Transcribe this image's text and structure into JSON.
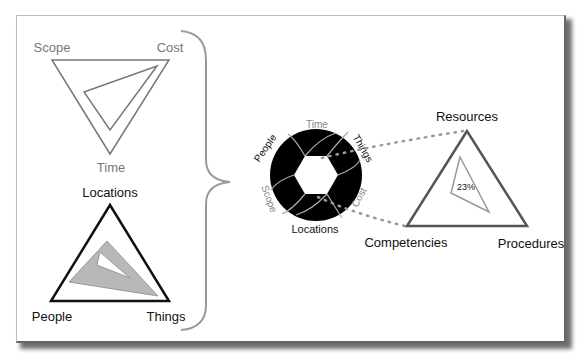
{
  "project_triangle": {
    "labels": {
      "top_left": "Scope",
      "top_right": "Cost",
      "bottom": "Time"
    },
    "colors": {
      "outline": "#777777",
      "text": "#777777"
    }
  },
  "asset_triangle": {
    "labels": {
      "top": "Locations",
      "bottom_left": "People",
      "bottom_right": "Things"
    },
    "colors": {
      "outline": "#111111",
      "text": "#111111",
      "set_square": "#b8b8b8"
    }
  },
  "aperture": {
    "labels": {
      "top": "Time",
      "upper_left": "People",
      "upper_right": "Things",
      "lower_left": "Scope",
      "lower_right": "Cost",
      "bottom": "Locations"
    },
    "colors": {
      "fill": "#000000",
      "blade_lines": "#aaaaaa",
      "gray_text": "#888888",
      "dark_text": "#111111"
    }
  },
  "capability_triangle": {
    "labels": {
      "top": "Resources",
      "bottom_left": "Competencies",
      "bottom_right": "Procedures"
    },
    "inner_value": "23%",
    "colors": {
      "outline": "#555555",
      "inner": "#999999",
      "connector": "#999999"
    }
  },
  "brace": {
    "color": "#999999"
  }
}
